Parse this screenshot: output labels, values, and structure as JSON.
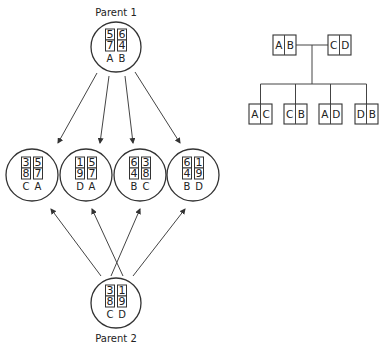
{
  "parents": [
    {
      "title": "Parent 1",
      "cx": 116,
      "cy": 47,
      "columns": [
        {
          "top": "5",
          "bottom": "7",
          "label": "A"
        },
        {
          "top": "6",
          "bottom": "4",
          "label": "B"
        }
      ]
    },
    {
      "title": "Parent 2",
      "cx": 116,
      "cy": 303,
      "columns": [
        {
          "top": "3",
          "bottom": "8",
          "label": "C"
        },
        {
          "top": "1",
          "bottom": "9",
          "label": "D"
        }
      ]
    }
  ],
  "offspring": [
    {
      "cx": 32,
      "cy": 175,
      "columns": [
        {
          "top": "3",
          "bottom": "8",
          "label": "C"
        },
        {
          "top": "5",
          "bottom": "7",
          "label": "A"
        }
      ]
    },
    {
      "cx": 86,
      "cy": 175,
      "columns": [
        {
          "top": "1",
          "bottom": "9",
          "label": "D"
        },
        {
          "top": "5",
          "bottom": "7",
          "label": "A"
        }
      ]
    },
    {
      "cx": 140,
      "cy": 175,
      "columns": [
        {
          "top": "6",
          "bottom": "4",
          "label": "B"
        },
        {
          "top": "3",
          "bottom": "8",
          "label": "C"
        }
      ]
    },
    {
      "cx": 193,
      "cy": 175,
      "columns": [
        {
          "top": "6",
          "bottom": "4",
          "label": "B"
        },
        {
          "top": "1",
          "bottom": "9",
          "label": "D"
        }
      ]
    }
  ],
  "arrows_from_parent1": [
    {
      "x1": 97,
      "y1": 73,
      "x2": 58,
      "y2": 143
    },
    {
      "x1": 109,
      "y1": 76,
      "x2": 100,
      "y2": 143
    },
    {
      "x1": 125,
      "y1": 76,
      "x2": 133,
      "y2": 143
    },
    {
      "x1": 135,
      "y1": 72,
      "x2": 180,
      "y2": 143
    }
  ],
  "arrows_from_parent2": [
    {
      "x1": 101,
      "y1": 276,
      "x2": 51,
      "y2": 209
    },
    {
      "x1": 123,
      "y1": 276,
      "x2": 92,
      "y2": 209
    },
    {
      "x1": 111,
      "y1": 276,
      "x2": 140,
      "y2": 209
    },
    {
      "x1": 133,
      "y1": 276,
      "x2": 185,
      "y2": 209
    }
  ],
  "pedigree": {
    "parents": [
      {
        "left": "A",
        "right": "B",
        "x": 273,
        "y": 35
      },
      {
        "left": "C",
        "right": "D",
        "x": 328,
        "y": 35
      }
    ],
    "children": [
      {
        "left": "A",
        "right": "C",
        "x": 249,
        "y": 104
      },
      {
        "left": "C",
        "right": "B",
        "x": 284,
        "y": 104
      },
      {
        "left": "A",
        "right": "D",
        "x": 319,
        "y": 104
      },
      {
        "left": "D",
        "right": "B",
        "x": 355,
        "y": 104
      }
    ]
  }
}
